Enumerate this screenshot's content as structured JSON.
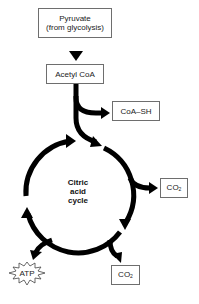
{
  "diagram": {
    "title": "Citric acid cycle",
    "nodes": {
      "pyruvate": {
        "line1": "Pyruvate",
        "line2": "(from glycolysis)"
      },
      "acetyl_coa": {
        "label": "Acetyl CoA"
      },
      "coa_sh": {
        "label": "CoA–SH"
      },
      "co2_right": {
        "label": "CO",
        "sub": "2"
      },
      "co2_bottom": {
        "label": "CO",
        "sub": "2"
      },
      "atp": {
        "label": "ATP"
      }
    },
    "cycle_label": {
      "line1": "Citric",
      "line2": "acid",
      "line3": "cycle"
    },
    "edges": [
      {
        "from": "Pyruvate",
        "to": "Acetyl CoA"
      },
      {
        "from": "Acetyl CoA",
        "to": "CoA–SH"
      },
      {
        "from": "Acetyl CoA",
        "to": "Citric acid cycle"
      },
      {
        "from": "Citric acid cycle",
        "to": "CO2"
      },
      {
        "from": "Citric acid cycle",
        "to": "CO2"
      },
      {
        "from": "Citric acid cycle",
        "to": "ATP"
      }
    ]
  }
}
